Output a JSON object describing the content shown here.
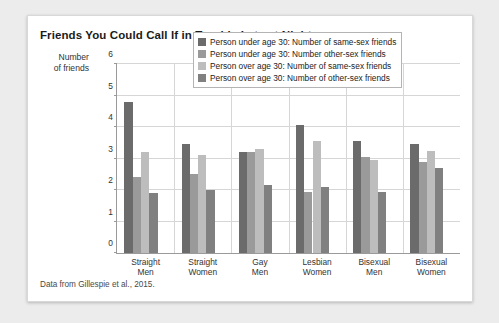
{
  "card": {
    "title": "Friends You Could Call If in Trouble Late at Night",
    "source_note": "Data from Gillespie et al., 2015."
  },
  "chart_data": {
    "type": "bar",
    "title": "Friends You Could Call If in Trouble Late at Night",
    "xlabel": "",
    "ylabel": "Number of friends",
    "ylim": [
      0,
      6
    ],
    "yticks": [
      0,
      1,
      2,
      3,
      4,
      5,
      6
    ],
    "grid": "horizontal",
    "legend_position": "top-right-inside",
    "categories": [
      "Straight Men",
      "Straight Women",
      "Gay Men",
      "Lesbian Women",
      "Bisexual Men",
      "Bisexual Women"
    ],
    "category_lines": [
      [
        "Straight",
        "Men"
      ],
      [
        "Straight",
        "Women"
      ],
      [
        "Gay",
        "Men"
      ],
      [
        "Lesbian",
        "Women"
      ],
      [
        "Bisexual",
        "Men"
      ],
      [
        "Bisexual",
        "Women"
      ]
    ],
    "series": [
      {
        "name": "Person under age 30: Number of same-sex friends",
        "color": "#6b6b6b",
        "values": [
          4.8,
          3.45,
          3.2,
          4.05,
          3.55,
          3.45
        ]
      },
      {
        "name": "Person under age 30: Number other-sex friends",
        "color": "#9a9a9a",
        "values": [
          2.4,
          2.5,
          3.2,
          1.95,
          3.05,
          2.9
        ]
      },
      {
        "name": "Person over age 30: Number of same-sex friends",
        "color": "#bdbdbd",
        "values": [
          3.2,
          3.1,
          3.3,
          3.55,
          2.95,
          3.25
        ]
      },
      {
        "name": "Person over age 30: Number of other-sex friends",
        "color": "#808080",
        "values": [
          1.9,
          2.0,
          2.15,
          2.1,
          1.95,
          2.7
        ]
      }
    ]
  }
}
